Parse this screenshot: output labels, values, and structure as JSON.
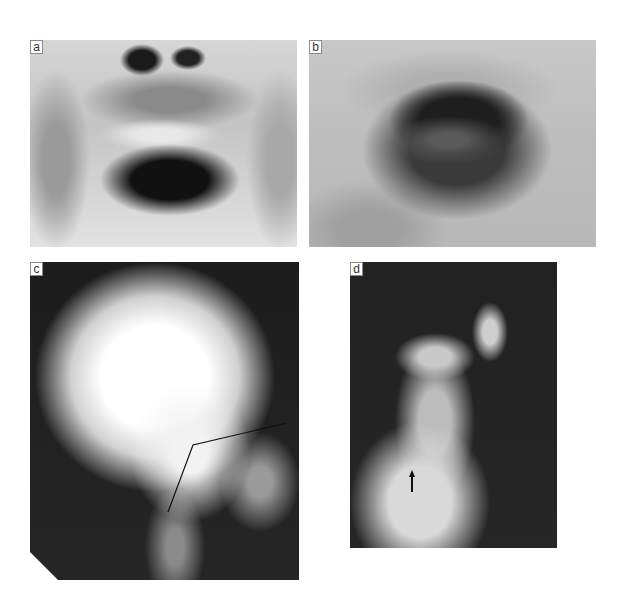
{
  "figure": {
    "panels": [
      {
        "id": "a",
        "label": "a",
        "description": "Photograph of infant's mouth, upper lip retracted by fingers showing teeth"
      },
      {
        "id": "b",
        "label": "b",
        "description": "Photograph of open mouth showing tongue and oral cavity"
      },
      {
        "id": "c",
        "label": "c",
        "description": "Lateral skull X-ray with drawn angle line"
      },
      {
        "id": "d",
        "label": "d",
        "description": "Photograph of hand with arrow annotation"
      }
    ]
  }
}
